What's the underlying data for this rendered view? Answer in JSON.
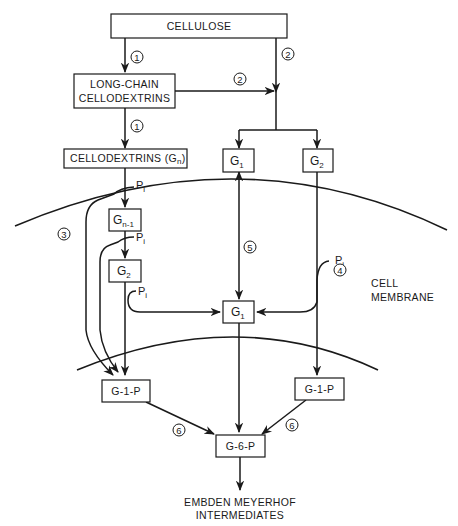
{
  "diagram": {
    "type": "metabolic-pathway",
    "nodes": {
      "cellulose": "CELLULOSE",
      "long_chain_line1": "LONG-CHAIN",
      "long_chain_line2": "CELLODEXTRINS",
      "cellodextrins": "CELLODEXTRINS (G",
      "cellodextrins_sub": "n",
      "cellodextrins_close": ")",
      "g1_top": "G",
      "g1_top_sub": "1",
      "g2_top": "G",
      "g2_top_sub": "2",
      "gn1": "G",
      "gn1_sub": "n-1",
      "g2_inner": "G",
      "g2_inner_sub": "2",
      "g1_center": "G",
      "g1_center_sub": "1",
      "g1p_left": "G-1-P",
      "g1p_right": "G-1-P",
      "g6p": "G-6-P"
    },
    "phosphate": {
      "p": "P",
      "sub": "i"
    },
    "steps": {
      "s1a": "1",
      "s1b": "1",
      "s2a": "2",
      "s2b": "2",
      "s3": "3",
      "s4": "4",
      "s5": "5",
      "s6a": "6",
      "s6b": "6"
    },
    "labels": {
      "cell_line1": "CELL",
      "cell_line2": "MEMBRANE",
      "output_line1": "EMBDEN MEYERHOF",
      "output_line2": "INTERMEDIATES"
    },
    "colors": {
      "ink": "#1a1a1a",
      "background": "#ffffff"
    }
  }
}
